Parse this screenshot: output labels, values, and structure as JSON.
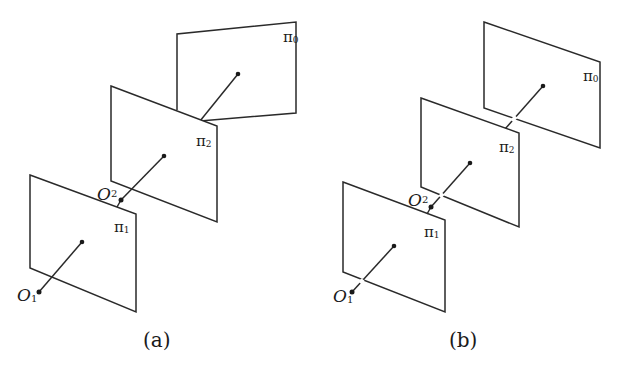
{
  "figure": {
    "panels": [
      {
        "id": "a",
        "caption": "(a)",
        "planes": [
          {
            "label": "π",
            "sub": "1"
          },
          {
            "label": "π",
            "sub": "2"
          },
          {
            "label": "π",
            "sub": "0"
          }
        ],
        "centers": [
          {
            "label": "O",
            "sub": "1"
          },
          {
            "label": "O",
            "sub": "2"
          }
        ]
      },
      {
        "id": "b",
        "caption": "(b)",
        "planes": [
          {
            "label": "π",
            "sub": "1"
          },
          {
            "label": "π",
            "sub": "2"
          },
          {
            "label": "π",
            "sub": "0"
          }
        ],
        "centers": [
          {
            "label": "O",
            "sub": "1"
          },
          {
            "label": "O",
            "sub": "2"
          }
        ]
      }
    ],
    "colors": {
      "line": "#2a2a2a",
      "background": "#ffffff"
    }
  }
}
